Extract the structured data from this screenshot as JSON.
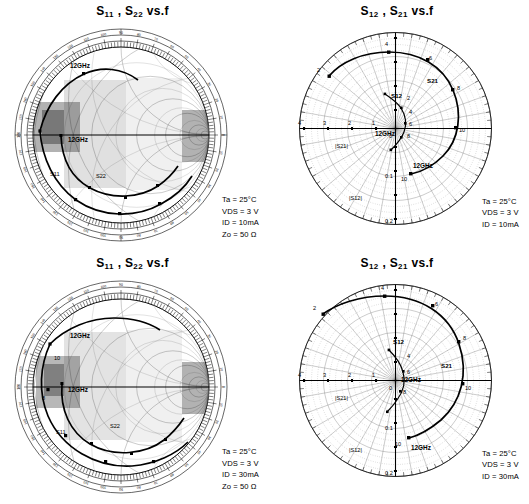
{
  "figure": {
    "kind": "s-parameter-charts",
    "panels": [
      {
        "id": "s11-s22-10ma",
        "title_main": "S",
        "title": "S11 , S22  vs.f",
        "title_parts": {
          "a": "S",
          "a_sub": "11",
          "sep": " , ",
          "b": "S",
          "b_sub": "22",
          "tail": " vs.f"
        },
        "chart_type": "smith",
        "conditions": [
          {
            "label": "Ta",
            "sub": "a",
            "value": "25°C",
            "text": "Ta = 25°C"
          },
          {
            "label": "V",
            "sub": "DS",
            "value": "3 V",
            "text": "VDS = 3 V"
          },
          {
            "label": "I",
            "sub": "D",
            "value": "10mA",
            "text": "ID = 10mA"
          },
          {
            "label": "Z",
            "sub": "o",
            "value": "50 Ω",
            "text": "Zo = 50 Ω"
          }
        ],
        "annotations": [
          {
            "text": "12GHz",
            "x": 78,
            "y": 66
          },
          {
            "text": "12GHz",
            "x": 76,
            "y": 128
          }
        ],
        "curve_labels": [
          {
            "text": "S11"
          },
          {
            "text": "S22"
          }
        ]
      },
      {
        "id": "s12-s21-10ma",
        "title": "S12 , S21  vs.f",
        "title_parts": {
          "a": "S",
          "a_sub": "12",
          "sep": " , ",
          "b": "S",
          "b_sub": "21",
          "tail": " vs.f"
        },
        "chart_type": "polar",
        "conditions": [
          {
            "label": "Ta",
            "sub": "a",
            "value": "25°C",
            "text": "Ta = 25°C"
          },
          {
            "label": "V",
            "sub": "DS",
            "value": "3 V",
            "text": "VDS = 3 V"
          },
          {
            "label": "I",
            "sub": "D",
            "value": "10mA",
            "text": "ID = 10mA"
          }
        ],
        "radial_labels_s21": [
          "4",
          "3",
          "2",
          "1",
          "0"
        ],
        "radial_labels_s12": [
          "0.1",
          "0.2"
        ],
        "axis_label_s21": "|S21|",
        "axis_label_s12": "|S12|",
        "curve_labels": [
          {
            "text": "S21"
          },
          {
            "text": "S12"
          }
        ],
        "freq_markers": [
          "2",
          "4",
          "6",
          "8",
          "10"
        ],
        "annotations": [
          {
            "text": "12GHz"
          }
        ]
      },
      {
        "id": "s11-s22-30ma",
        "title": "S11 , S22  vs.f",
        "title_parts": {
          "a": "S",
          "a_sub": "11",
          "sep": " , ",
          "b": "S",
          "b_sub": "22",
          "tail": " vs.f"
        },
        "chart_type": "smith",
        "conditions": [
          {
            "label": "Ta",
            "sub": "a",
            "value": "25°C",
            "text": "Ta = 25°C"
          },
          {
            "label": "V",
            "sub": "DS",
            "value": "3 V",
            "text": "VDS = 3 V"
          },
          {
            "label": "I",
            "sub": "D",
            "value": "30mA",
            "text": "ID = 30mA"
          },
          {
            "label": "Z",
            "sub": "o",
            "value": "50 Ω",
            "text": "Zo = 50 Ω"
          }
        ],
        "annotations": [
          {
            "text": "12GHz",
            "x": 78,
            "y": 70
          },
          {
            "text": "12GHz",
            "x": 80,
            "y": 128
          }
        ],
        "curve_labels": [
          {
            "text": "S11"
          },
          {
            "text": "S22"
          }
        ]
      },
      {
        "id": "s12-s21-30ma",
        "title": "S12 , S21  vs.f",
        "title_parts": {
          "a": "S",
          "a_sub": "12",
          "sep": " , ",
          "b": "S",
          "b_sub": "21",
          "tail": " vs.f"
        },
        "chart_type": "polar",
        "conditions": [
          {
            "label": "Ta",
            "sub": "a",
            "value": "25°C",
            "text": "Ta = 25°C"
          },
          {
            "label": "V",
            "sub": "DS",
            "value": "3 V",
            "text": "VDS = 3 V"
          },
          {
            "label": "I",
            "sub": "D",
            "value": "30mA",
            "text": "ID = 30mA"
          }
        ],
        "radial_labels_s21": [
          "4",
          "3",
          "2",
          "1",
          "0"
        ],
        "radial_labels_s12": [
          "0.1",
          "0.2"
        ],
        "axis_label_s21": "|S21|",
        "axis_label_s12": "|S12|",
        "curve_labels": [
          {
            "text": "S21"
          },
          {
            "text": "S12"
          }
        ],
        "freq_markers": [
          "2",
          "4",
          "6",
          "8",
          "10"
        ],
        "annotations": [
          {
            "text": "12GHz"
          }
        ]
      }
    ]
  },
  "chart_data": [
    {
      "type": "scatter",
      "title": "S11 , S22 vs.f",
      "subtype": "smith-chart",
      "xlabel": "Real (Γ)",
      "ylabel": "Imag (Γ)",
      "xlim": [
        -1,
        1
      ],
      "ylim": [
        -1,
        1
      ],
      "grid": true,
      "legend": "none",
      "annotations": [
        "12GHz",
        "12GHz"
      ],
      "conditions": {
        "Ta": "25°C",
        "VDS": "3 V",
        "ID": "10mA",
        "Zo": "50 Ω"
      },
      "series": [
        {
          "name": "S11",
          "freq_ghz": [
            2,
            4,
            6,
            8,
            10,
            12
          ],
          "mag": [
            0.93,
            0.88,
            0.82,
            0.76,
            0.71,
            0.66
          ],
          "angle_deg": [
            -40,
            -72,
            -104,
            -136,
            -166,
            168
          ]
        },
        {
          "name": "S22",
          "freq_ghz": [
            2,
            4,
            6,
            8,
            10,
            12
          ],
          "mag": [
            0.72,
            0.66,
            0.6,
            0.55,
            0.52,
            0.5
          ],
          "angle_deg": [
            -30,
            -55,
            -80,
            -106,
            -130,
            -155
          ]
        }
      ]
    },
    {
      "type": "scatter",
      "title": "S12 , S21 vs.f",
      "subtype": "polar",
      "xlabel": "|S21|",
      "ylabel": "|S12|",
      "grid": true,
      "legend": "none",
      "radial_ticks_s21": [
        0,
        1,
        2,
        3,
        4
      ],
      "radial_ticks_s12": [
        0.1,
        0.2
      ],
      "angle_range_deg": [
        0,
        360
      ],
      "annotations": [
        "12GHz"
      ],
      "conditions": {
        "Ta": "25°C",
        "VDS": "3 V",
        "ID": "10mA"
      },
      "series": [
        {
          "name": "S21",
          "freq_ghz": [
            2,
            4,
            6,
            8,
            10,
            12
          ],
          "mag": [
            3.6,
            3.3,
            2.9,
            2.4,
            1.9,
            1.4
          ],
          "angle_deg": [
            150,
            108,
            66,
            30,
            -6,
            -42
          ]
        },
        {
          "name": "S12",
          "freq_ghz": [
            2,
            4,
            6,
            8,
            10,
            12
          ],
          "mag": [
            0.035,
            0.055,
            0.07,
            0.08,
            0.085,
            0.09
          ],
          "angle_deg": [
            72,
            50,
            26,
            2,
            -26,
            -58
          ]
        }
      ]
    },
    {
      "type": "scatter",
      "title": "S11 , S22 vs.f",
      "subtype": "smith-chart",
      "xlabel": "Real (Γ)",
      "ylabel": "Imag (Γ)",
      "xlim": [
        -1,
        1
      ],
      "ylim": [
        -1,
        1
      ],
      "grid": true,
      "legend": "none",
      "annotations": [
        "12GHz",
        "12GHz"
      ],
      "conditions": {
        "Ta": "25°C",
        "VDS": "3 V",
        "ID": "30mA",
        "Zo": "50 Ω"
      },
      "series": [
        {
          "name": "S11",
          "freq_ghz": [
            2,
            4,
            6,
            8,
            10,
            12
          ],
          "mag": [
            0.92,
            0.87,
            0.81,
            0.75,
            0.7,
            0.65
          ],
          "angle_deg": [
            -44,
            -78,
            -110,
            -142,
            -172,
            160
          ]
        },
        {
          "name": "S22",
          "freq_ghz": [
            2,
            4,
            6,
            8,
            10,
            12
          ],
          "mag": [
            0.7,
            0.64,
            0.58,
            0.54,
            0.51,
            0.49
          ],
          "angle_deg": [
            -34,
            -60,
            -86,
            -112,
            -136,
            -160
          ]
        }
      ]
    },
    {
      "type": "scatter",
      "title": "S12 , S21 vs.f",
      "subtype": "polar",
      "xlabel": "|S21|",
      "ylabel": "|S12|",
      "grid": true,
      "legend": "none",
      "radial_ticks_s21": [
        0,
        1,
        2,
        3,
        4
      ],
      "radial_ticks_s12": [
        0.1,
        0.2
      ],
      "angle_range_deg": [
        0,
        360
      ],
      "annotations": [
        "12GHz"
      ],
      "conditions": {
        "Ta": "25°C",
        "VDS": "3 V",
        "ID": "30mA"
      },
      "series": [
        {
          "name": "S21",
          "freq_ghz": [
            2,
            4,
            6,
            8,
            10,
            12
          ],
          "mag": [
            3.8,
            3.5,
            3.1,
            2.6,
            2.0,
            1.5
          ],
          "angle_deg": [
            152,
            110,
            68,
            30,
            -8,
            -46
          ]
        },
        {
          "name": "S12",
          "freq_ghz": [
            2,
            4,
            6,
            8,
            10,
            12
          ],
          "mag": [
            0.04,
            0.06,
            0.075,
            0.085,
            0.09,
            0.095
          ],
          "angle_deg": [
            70,
            48,
            24,
            0,
            -28,
            -60
          ]
        }
      ]
    }
  ]
}
